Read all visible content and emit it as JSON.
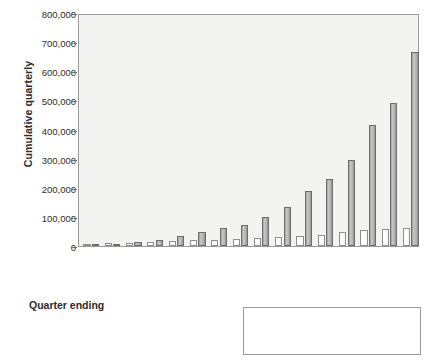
{
  "chart_data": {
    "type": "bar",
    "title": "",
    "xlabel": "Quarter ending",
    "ylabel": "Cumulative quarterly",
    "ylim": [
      0,
      800000
    ],
    "ytick_labels": [
      "800,000",
      "700,000",
      "600,000",
      "500,000",
      "400,000",
      "300,000",
      "200,000",
      "100,000",
      "0"
    ],
    "ytick_values": [
      800000,
      700000,
      600000,
      500000,
      400000,
      300000,
      200000,
      100000,
      0
    ],
    "grid": false,
    "legend_position": "bottom-right",
    "categories": [
      "Jul 1998",
      "Oct 1998",
      "Jan 1999",
      "Apr 1999",
      "Jun 1999",
      "Oct 1999",
      "Jan 2000",
      "Apr 2000",
      "Jun 2000",
      "Oct 2000",
      "Dec 2000",
      "Mar 2001",
      "Jul 2001",
      "Sep 2001",
      "Jan 2002",
      "Apr 2002"
    ],
    "series": [
      {
        "name": "Printed version",
        "color": "#ffffff",
        "values": [
          6000,
          10000,
          11000,
          13000,
          16000,
          20000,
          22000,
          24000,
          26000,
          31000,
          35000,
          39000,
          48000,
          55000,
          59000,
          62000
        ]
      },
      {
        "name": "Electronic version on web",
        "color": "#b4b4b4",
        "values": [
          8000,
          7000,
          14000,
          22000,
          35000,
          49000,
          61000,
          72000,
          99000,
          134000,
          190000,
          231000,
          296000,
          416000,
          490000,
          665000
        ]
      }
    ],
    "note_max_bar": 800000
  },
  "axes": {
    "y_title": "Cumulative quarterly",
    "x_title": "Quarter ending"
  },
  "legend": {
    "items": [
      {
        "label": "Printed version",
        "swatch": "printed"
      },
      {
        "label": "Electronic version on web",
        "swatch": "electronic"
      }
    ]
  }
}
